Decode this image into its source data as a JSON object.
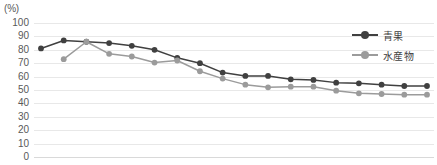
{
  "chart_data": {
    "type": "line",
    "title": "",
    "subtitle": "",
    "unit_label": "(%)",
    "xlabel": "",
    "ylabel": "",
    "ylim": [
      0,
      100
    ],
    "ytick_step": 10,
    "yticks": [
      100,
      90,
      80,
      70,
      60,
      50,
      40,
      30,
      20,
      10,
      0
    ],
    "grid": true,
    "legend_position": "top-right",
    "categories": [
      "1",
      "2",
      "3",
      "4",
      "5",
      "6",
      "7",
      "8",
      "9",
      "10",
      "11",
      "12",
      "13",
      "14",
      "15",
      "16",
      "17",
      "18"
    ],
    "xtick_labels_visible": false,
    "series": [
      {
        "name": "青果",
        "color": "#404040",
        "marker": "circle",
        "values": [
          81,
          87,
          86,
          85,
          83,
          80,
          74,
          70,
          63,
          60.5,
          60.5,
          58,
          57.5,
          55.5,
          55,
          54,
          53,
          53
        ]
      },
      {
        "name": "水産物",
        "color": "#9b9b9b",
        "marker": "circle",
        "values": [
          null,
          73,
          86,
          77,
          75,
          70.5,
          72,
          64,
          58.5,
          54,
          52,
          52.5,
          52.5,
          49.5,
          47.5,
          47,
          46.5,
          46.5
        ]
      }
    ]
  },
  "legend": {
    "items": [
      {
        "label": "青果",
        "color": "#404040"
      },
      {
        "label": "水産物",
        "color": "#9b9b9b"
      }
    ]
  },
  "axes": {
    "unit": "(%)"
  }
}
